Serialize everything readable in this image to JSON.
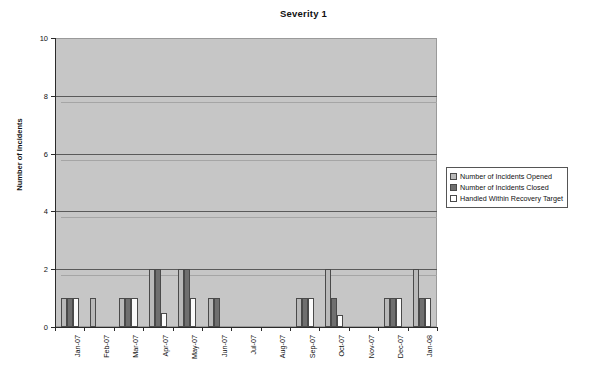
{
  "chart_data": {
    "type": "bar",
    "title": "Severity 1",
    "xlabel": "",
    "ylabel": "Number of Incidents",
    "ylim": [
      0,
      10
    ],
    "ytick_values": [
      0,
      2,
      4,
      6,
      8,
      10
    ],
    "ytick_labels": [
      "0",
      "2",
      "4",
      "6",
      "8",
      "10"
    ],
    "grid": true,
    "grid_axis": "y",
    "legend_position": "right",
    "style": "3d-clustered-column",
    "categories": [
      "Jan-07",
      "Feb-07",
      "Mar-07",
      "Apr-07",
      "May-07",
      "Jun-07",
      "Jul-07",
      "Aug-07",
      "Sep-07",
      "Oct-07",
      "Nov-07",
      "Dec-07",
      "Jan-08"
    ],
    "series": [
      {
        "name": "Number of Incidents Opened",
        "color": "#b9b9b9",
        "values": [
          1,
          1,
          1,
          2,
          2,
          1,
          0,
          0,
          1,
          2,
          0,
          1,
          2
        ]
      },
      {
        "name": "Number of Incidents Closed",
        "color": "#6f6f6f",
        "values": [
          1,
          0,
          1,
          2,
          2,
          1,
          0,
          0,
          1,
          1,
          0,
          1,
          1
        ]
      },
      {
        "name": "Handled Within Recovery Target",
        "color": "#ffffff",
        "values": [
          1,
          0,
          1,
          0.5,
          1,
          0,
          0,
          0,
          1,
          0.4,
          0,
          1,
          1
        ]
      }
    ]
  },
  "legend": {
    "items": [
      {
        "label": "Number of Incidents Opened"
      },
      {
        "label": "Number of Incidents Closed"
      },
      {
        "label": "Handled Within Recovery Target"
      }
    ]
  },
  "footer": {
    "note": ""
  }
}
